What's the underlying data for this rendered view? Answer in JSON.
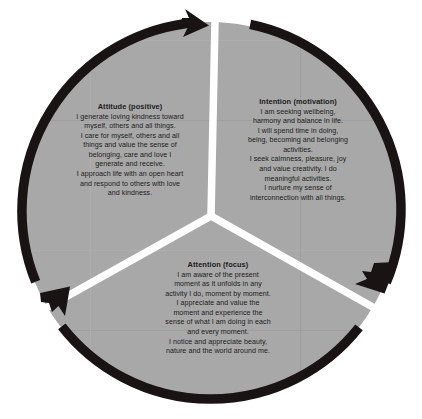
{
  "diagram": {
    "name": "Mindfulness three-part cycle wheel",
    "type": "cyclic-pie-diagram",
    "shape": "circle divided into three equal wedges with clockwise arrows on the outer ring",
    "colors": {
      "background": "#ffffff",
      "wedge_fill": "#a8a8a8",
      "ring_and_arrows": "#1a1313",
      "divider": "#ffffff",
      "text": "#1c1c1c"
    },
    "geometry": {
      "center_x": 210,
      "center_y": 211,
      "radius": 193,
      "ring_thickness": 9,
      "divider_thickness": 7,
      "segment_count": 3,
      "arrow_direction": "clockwise"
    },
    "segments": [
      {
        "id": "attitude",
        "title": "Attitude (positive)",
        "body": "I generate loving kindness toward\nmyself, others and all things.\nI care for myself, others and all\nthings and value the sense of\nbelonging, care and love I\ngenerate and receive.\nI approach life with an open heart\nand respond to others with love\nand kindness.",
        "position": "upper-left wedge"
      },
      {
        "id": "intention",
        "title": "Intention (motivation)",
        "body": "I am seeking wellbeing,\nharmony and balance in life.\nI will spend time in doing,\nbeing, becoming and belonging\nactivities.\nI seek calmness, pleasure, joy\nand value creativity. I do\nmeaningful activities.\nI nurture my sense of\ninterconnection with all things.",
        "position": "upper-right wedge"
      },
      {
        "id": "attention",
        "title": "Attention (focus)",
        "body": "I am aware of the present\nmoment as it unfolds in any\nactivity I do, moment by moment.\nI appreciate and value the\nmoment and experience the\nsense of what I am doing in each\nand every moment.\nI notice and appreciate beauty,\nnature and the world around me.",
        "position": "bottom wedge"
      }
    ],
    "arrows": [
      {
        "id": "arrow-top",
        "label": "clockwise-arrow-top",
        "angle_deg": -90
      },
      {
        "id": "arrow-lower-right",
        "label": "clockwise-arrow-lower-right",
        "angle_deg": 30
      },
      {
        "id": "arrow-lower-left",
        "label": "clockwise-arrow-lower-left",
        "angle_deg": 150
      }
    ]
  }
}
